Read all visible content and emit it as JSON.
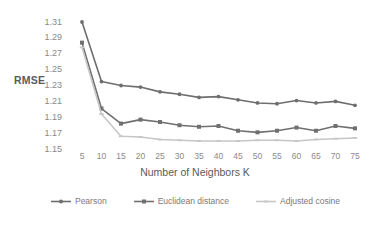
{
  "chart_data": {
    "type": "line",
    "title": "",
    "xlabel": "Number of Neighbors K",
    "ylabel": "RMSE",
    "x": [
      5,
      10,
      15,
      20,
      25,
      30,
      35,
      40,
      45,
      50,
      55,
      60,
      65,
      70,
      75
    ],
    "xtick_labels": [
      "5",
      "10",
      "15",
      "20",
      "25",
      "30",
      "35",
      "40",
      "45",
      "50",
      "55",
      "60",
      "65",
      "70",
      "75"
    ],
    "ytick_labels": [
      "1.31",
      "1.29",
      "1.27",
      "1.25",
      "1.23",
      "1.21",
      "1.19",
      "1.17",
      "1.15"
    ],
    "ytick_values": [
      1.31,
      1.29,
      1.27,
      1.25,
      1.23,
      1.21,
      1.19,
      1.17,
      1.15
    ],
    "ylim": [
      1.15,
      1.31
    ],
    "grid": false,
    "legend_position": "bottom",
    "series": [
      {
        "name": "Pearson",
        "color": "#6e6e6e",
        "marker": "circle",
        "values": [
          1.31,
          1.235,
          1.23,
          1.228,
          1.222,
          1.219,
          1.215,
          1.216,
          1.212,
          1.208,
          1.207,
          1.211,
          1.208,
          1.21,
          1.205
        ]
      },
      {
        "name": "Euclidean distance",
        "color": "#707070",
        "marker": "square",
        "values": [
          1.284,
          1.201,
          1.182,
          1.187,
          1.184,
          1.18,
          1.178,
          1.179,
          1.173,
          1.171,
          1.173,
          1.177,
          1.173,
          1.179,
          1.176
        ]
      },
      {
        "name": "Adjusted cosine",
        "color": "#c6c6c6",
        "marker": "dash",
        "values": [
          1.278,
          1.194,
          1.166,
          1.165,
          1.162,
          1.161,
          1.16,
          1.16,
          1.16,
          1.161,
          1.161,
          1.16,
          1.162,
          1.163,
          1.164
        ]
      }
    ]
  },
  "legend": {
    "items": [
      {
        "label": "Pearson"
      },
      {
        "label": "Euclidean distance"
      },
      {
        "label": "Adjusted cosine"
      }
    ]
  },
  "axes": {
    "y_title": "RMSE",
    "x_title": "Number of Neighbors K"
  }
}
